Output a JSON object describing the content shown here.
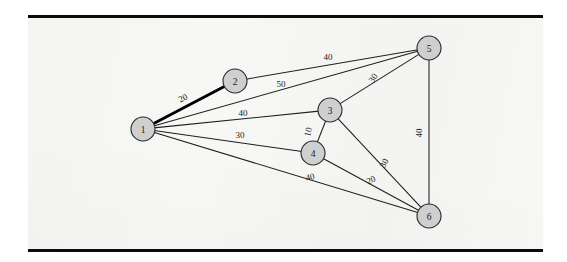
{
  "figure": {
    "kind": "weighted-undirected-graph",
    "background_color": "#f7f7f5",
    "rule_color": "#0b0b0b",
    "node_fill": "#cfcfcf",
    "node_stroke": "#2b2b2b",
    "edge_color": "#1e1e1e",
    "highlight_color": "#000000"
  },
  "chart_data": {
    "type": "diagram",
    "title": "",
    "xlabel": "",
    "ylabel": "",
    "nodes": [
      {
        "id": "1",
        "label": "1",
        "x": 143,
        "y": 129,
        "r": 12
      },
      {
        "id": "2",
        "label": "2",
        "x": 235,
        "y": 81,
        "r": 12
      },
      {
        "id": "3",
        "label": "3",
        "x": 330,
        "y": 110,
        "r": 12
      },
      {
        "id": "4",
        "label": "4",
        "x": 313,
        "y": 153,
        "r": 12
      },
      {
        "id": "5",
        "label": "5",
        "x": 429,
        "y": 48,
        "r": 12
      },
      {
        "id": "6",
        "label": "6",
        "x": 429,
        "y": 216,
        "r": 12
      }
    ],
    "edges": [
      {
        "id": "e-1-2",
        "from": "1",
        "to": "2",
        "weight": "20",
        "highlighted": true,
        "label_x": 183,
        "label_y": 98,
        "label_rot": -27
      },
      {
        "id": "e-2-5",
        "from": "2",
        "to": "5",
        "weight": "40",
        "highlighted": false,
        "label_x": 328,
        "label_y": 57,
        "label_rot": 0
      },
      {
        "id": "e-1-5",
        "from": "1",
        "to": "5",
        "weight": "50",
        "highlighted": false,
        "label_x": 281,
        "label_y": 84,
        "label_rot": 0
      },
      {
        "id": "e-3-5",
        "from": "3",
        "to": "5",
        "weight": "30",
        "highlighted": false,
        "label_x": 373,
        "label_y": 78,
        "label_rot": -55
      },
      {
        "id": "e-1-3",
        "from": "1",
        "to": "3",
        "weight": "40",
        "highlighted": false,
        "label_x": 243,
        "label_y": 113,
        "label_rot": 0
      },
      {
        "id": "e-3-4",
        "from": "3",
        "to": "4",
        "weight": "10",
        "highlighted": false,
        "label_x": 308,
        "label_y": 132,
        "label_rot": -78
      },
      {
        "id": "e-1-4",
        "from": "1",
        "to": "4",
        "weight": "30",
        "labelled": true,
        "highlighted": false,
        "label_x": 240,
        "label_y": 135,
        "label_rot": 0
      },
      {
        "id": "e-3-6",
        "from": "3",
        "to": "6",
        "weight": "30",
        "highlighted": false,
        "label_x": 384,
        "label_y": 163,
        "label_rot": -62
      },
      {
        "id": "e-4-6",
        "from": "4",
        "to": "6",
        "weight": "20",
        "highlighted": false,
        "label_x": 371,
        "label_y": 180,
        "label_rot": -22
      },
      {
        "id": "e-1-6",
        "from": "1",
        "to": "6",
        "weight": "40",
        "highlighted": false,
        "label_x": 310,
        "label_y": 177,
        "label_rot": -15
      },
      {
        "id": "e-5-6",
        "from": "5",
        "to": "6",
        "weight": "40",
        "highlighted": false,
        "label_x": 419,
        "label_y": 133,
        "label_rot": -90
      }
    ],
    "legend": [],
    "annotations": []
  }
}
